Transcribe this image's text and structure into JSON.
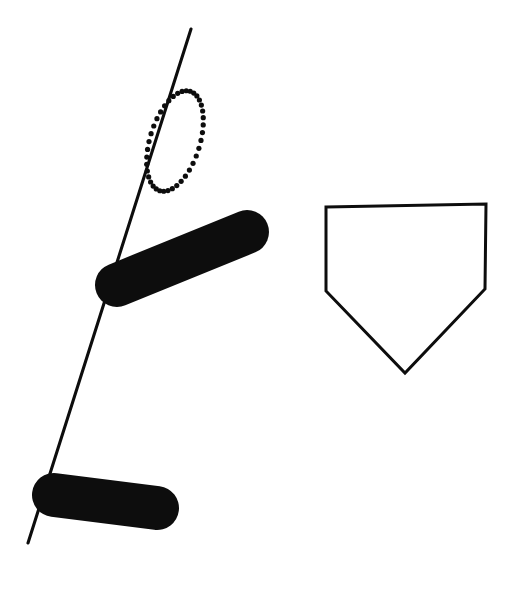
{
  "figure": {
    "canvas": {
      "width": 515,
      "height": 615
    },
    "background_color": "#ffffff",
    "ink_color": "#0d0d0d"
  },
  "elements": {
    "diagonal_line": {
      "name": "diagonal-line",
      "description": "Long thin straight line running from upper-right to lower-left",
      "start": {
        "x": 191,
        "y": 29
      },
      "end": {
        "x": 28,
        "y": 543
      },
      "stroke_width": 3.1,
      "color": "#0d0d0d"
    },
    "dotted_ellipse": {
      "name": "dotted-ellipse",
      "description": "Tilted oval outlined with round dots, overlapping the diagonal line",
      "center": {
        "x": 175,
        "y": 141
      },
      "radius_x": 25,
      "radius_y": 52,
      "rotation_deg": 17,
      "dot_radius": 2.6,
      "dot_count": 40,
      "color": "#0d0d0d"
    },
    "upper_blob": {
      "name": "upper-blob",
      "description": "Thick solid black elongated lozenge sloping up to the right, crossing the diagonal line",
      "tip_left": {
        "x": 117,
        "y": 285
      },
      "tip_right": {
        "x": 247,
        "y": 232
      },
      "thickness": 44,
      "color": "#0d0d0d"
    },
    "lower_blob": {
      "name": "lower-blob",
      "description": "Thick solid black elongated lozenge near the bottom-left, crossing the diagonal line",
      "tip_left": {
        "x": 54,
        "y": 495
      },
      "tip_right": {
        "x": 157,
        "y": 508
      },
      "thickness": 44,
      "color": "#0d0d0d"
    },
    "home_plate_pentagon": {
      "name": "home-plate-pentagon",
      "description": "Outlined pentagon shaped like a baseball home plate, point facing down",
      "vertices": [
        {
          "x": 326,
          "y": 207
        },
        {
          "x": 486,
          "y": 204
        },
        {
          "x": 485,
          "y": 289
        },
        {
          "x": 405,
          "y": 373
        },
        {
          "x": 326,
          "y": 291
        }
      ],
      "stroke_width": 3,
      "fill": "none",
      "color": "#0d0d0d"
    }
  }
}
